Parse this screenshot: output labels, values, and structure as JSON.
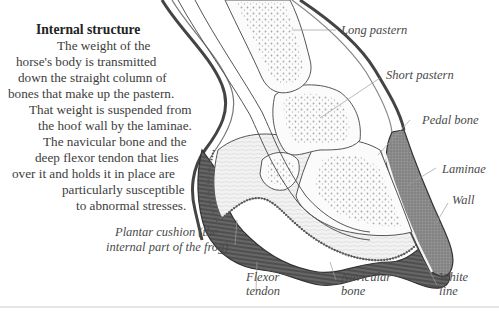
{
  "intro": {
    "title": "Internal structure",
    "lines": [
      "The weight of the",
      "horse's body is transmitted",
      "down the straight column of",
      "bones that make up the pastern.",
      "That weight is suspended from",
      "the hoof wall by the laminae.",
      "The navicular bone and the",
      "deep flexor tendon that lies",
      "over it and holds it in place are",
      "particularly susceptible",
      "to abnormal stresses."
    ]
  },
  "labels": {
    "long_pastern": "Long pastern",
    "short_pastern": "Short pastern",
    "pedal_bone": "Pedal bone",
    "laminae": "Laminae",
    "wall": "Wall",
    "plantar_cushion_1": "Plantar cushion (the",
    "plantar_cushion_2": "internal part of the frog)",
    "flexor_tendon_1": "Flexor",
    "flexor_tendon_2": "tendon",
    "navicular_bone_1": "Navicular",
    "navicular_bone_2": "bone",
    "white_line_1": "White",
    "white_line_2": "line"
  },
  "colors": {
    "ink": "#3a3a3a",
    "wall_fill": "#8a8a8a",
    "sole_fill": "#5e5e5e",
    "bone_stipple": "#9a9a9a",
    "leader_line": "#9c9c9c"
  }
}
